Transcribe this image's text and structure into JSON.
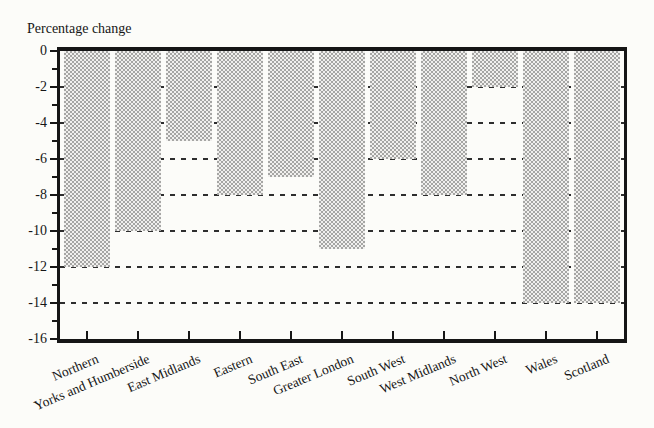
{
  "chart_data": {
    "type": "bar",
    "title": "Percentage change",
    "categories": [
      "Northern",
      "Yorks and Humberside",
      "East Midlands",
      "Eastern",
      "South East",
      "Greater London",
      "South West",
      "West Midlands",
      "North West",
      "Wales",
      "Scotland"
    ],
    "values": [
      -12,
      -10,
      -5,
      -8,
      -7,
      -11,
      -6,
      -8,
      -2,
      -14,
      -14
    ],
    "xlabel": "",
    "ylabel": "Percentage change",
    "ylim": [
      -16,
      0
    ],
    "y_ticks_major": [
      0,
      -2,
      -4,
      -6,
      -8,
      -10,
      -12,
      -14,
      -16
    ],
    "y_ticks_minor": [
      -1,
      -3,
      -5,
      -7,
      -9,
      -11,
      -13,
      -15
    ],
    "gridlines": [
      -2,
      -4,
      -6,
      -8,
      -10,
      -12,
      -14
    ],
    "grid_style": "dashed-horizontal",
    "legend": "none",
    "bar_fill": "halftone-gray",
    "colors": {
      "axis": "#161616",
      "text": "#161616",
      "grid_dash": "#2e2e2e",
      "bar_dot": "#a6a6a4",
      "bar_base": "#f1f0ee",
      "background": "#fcfcf9"
    }
  }
}
